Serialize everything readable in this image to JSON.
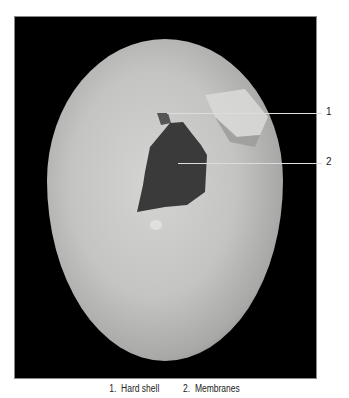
{
  "figure": {
    "labels": [
      {
        "id": "1",
        "text": "1"
      },
      {
        "id": "2",
        "text": "2"
      }
    ],
    "caption": [
      {
        "number": "1.",
        "text": "Hard shell"
      },
      {
        "number": "2.",
        "text": "Membranes"
      }
    ]
  }
}
